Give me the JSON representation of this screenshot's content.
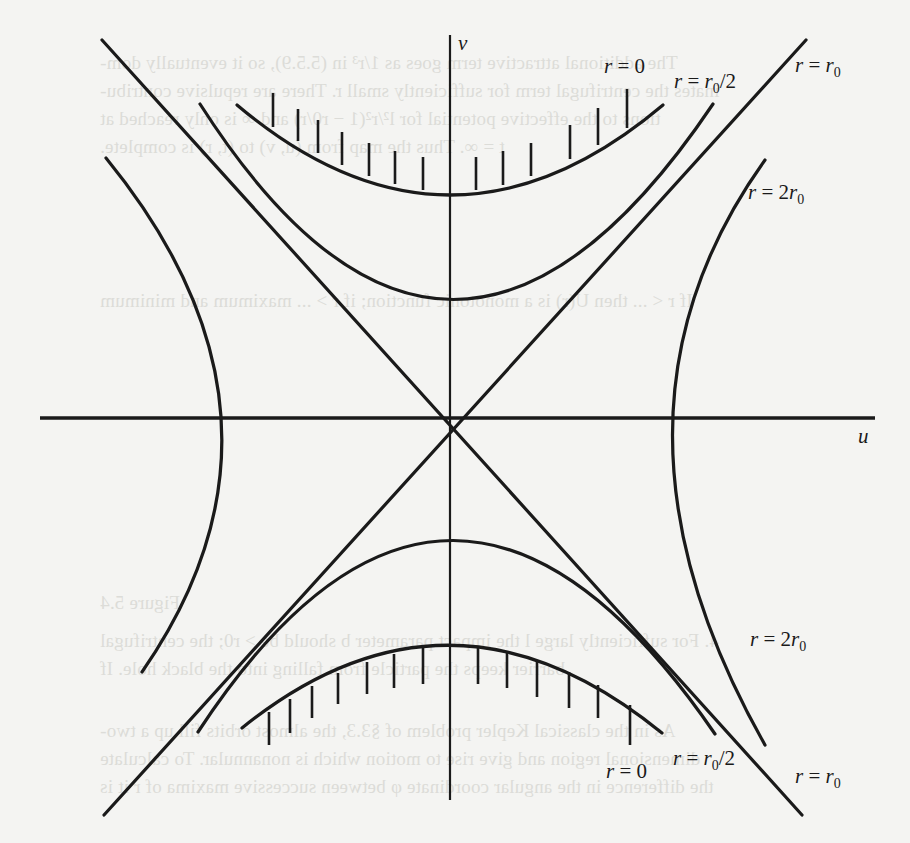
{
  "figure": {
    "axes": {
      "horizontal_label": "u",
      "vertical_label": "v"
    },
    "curve_labels": {
      "upper_singularity": "r = 0",
      "upper_half_radius": "r = r0/2",
      "upper_horizon": "r = r0",
      "upper_right_exterior": "r = 2r0",
      "lower_right_exterior": "r = 2r0",
      "lower_singularity": "r = 0",
      "lower_half_radius": "r = r0/2",
      "lower_horizon": "r = r0"
    },
    "label_parts": {
      "r_eq": "r = ",
      "zero": "0",
      "r": "r",
      "sub0": "0",
      "half": "/2",
      "two": "2"
    }
  },
  "background_show_through_text": [
    "The additional attractive term goes as 1/r³ in (5.5.9), so it eventually dom-",
    "inates the centrifugal term for sufficiently small r. There are repulsive contribu-",
    "tions to the effective potential for l²/r²(1 − r0/r) and ∞ is only reached at",
    "t = ∞. Thus the map from (u, v) to (t, r) is complete.",
    "If r < ... then U(r) is a monotonic function; if r > ... maximum and minimum",
    "Figure 5.4",
    "4. For sufficiently large l the impact parameter b should be > r0; the centrifugal",
    "barrier keeps the particle from falling into the black hole. If",
    "As in the classical Kepler problem of §3.3, the almost orbits fill up a two-",
    "dimensional region and give rise to motion which is nonannular. To calculate",
    "the difference in the angular coordinate φ between successive maxima of r it is"
  ]
}
